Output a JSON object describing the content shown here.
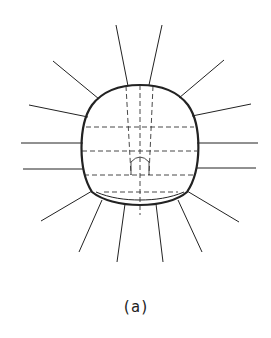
{
  "figure": {
    "caption": "(a)",
    "colors": {
      "line": "#222222",
      "background": "#ffffff"
    }
  }
}
